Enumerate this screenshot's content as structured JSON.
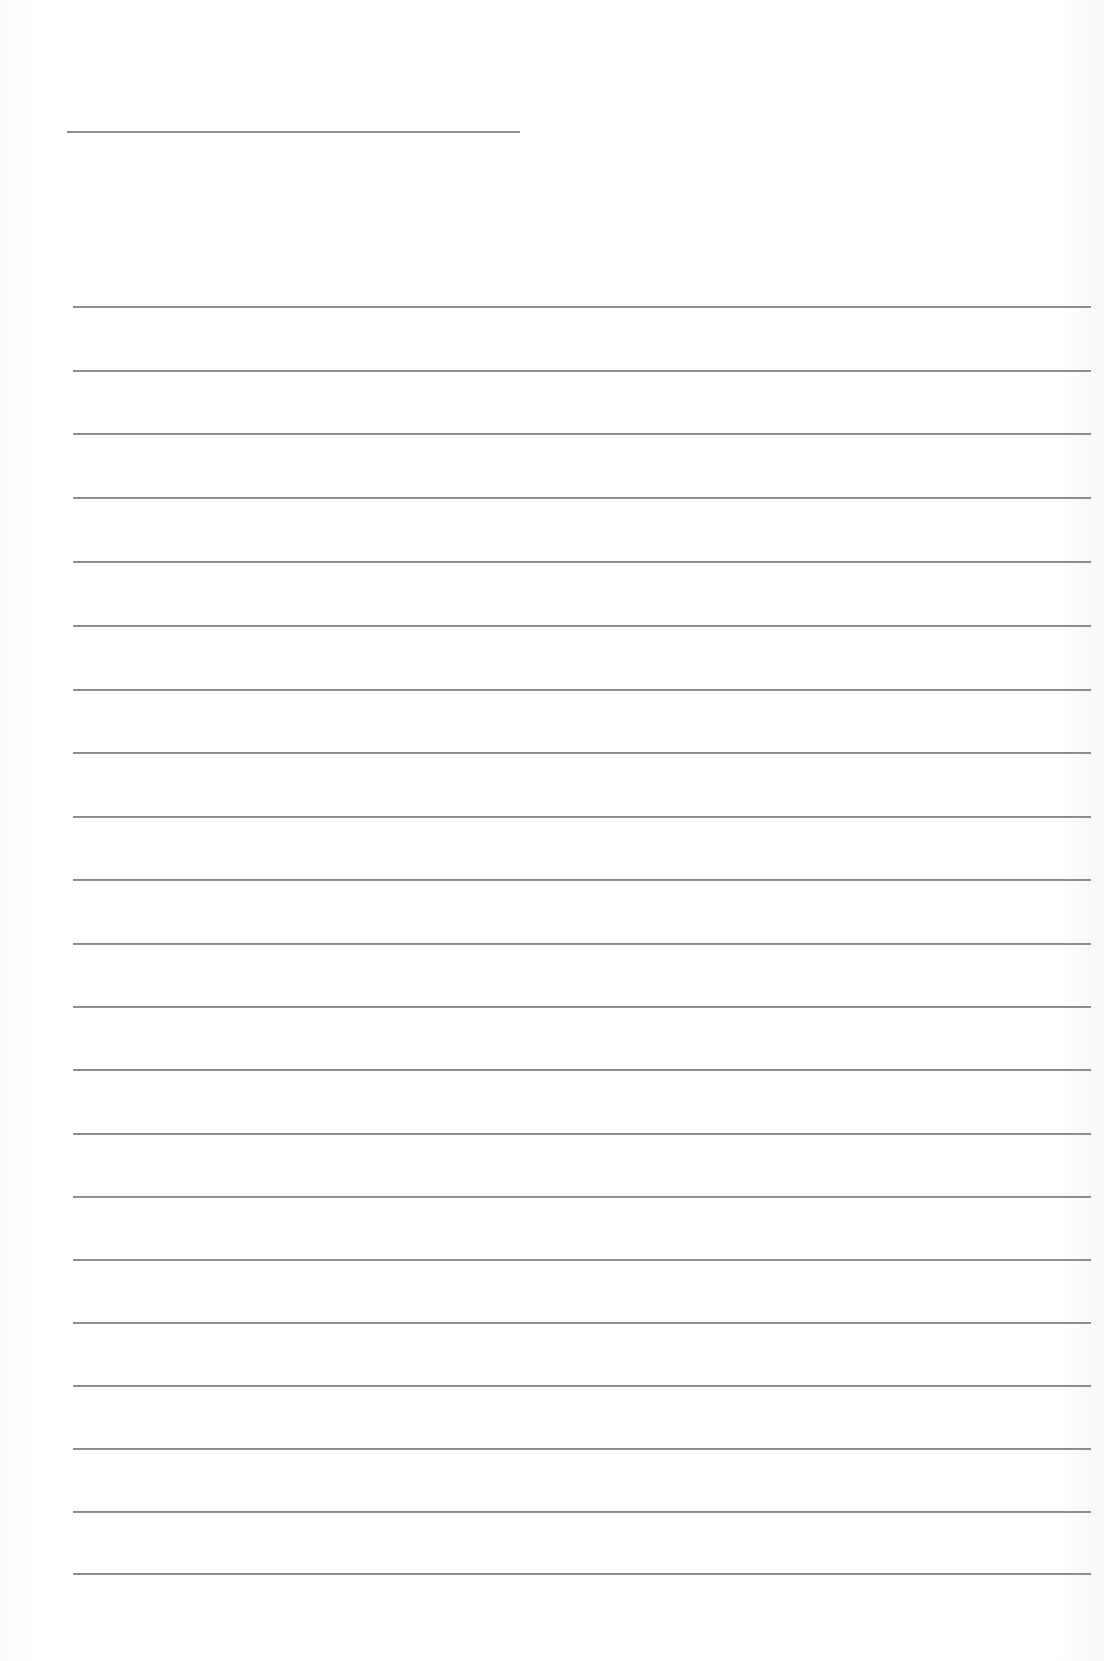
{
  "page": {
    "type": "lined-paper",
    "background_color": "#ffffff",
    "line_color": "#8a8a8a",
    "title_line": {
      "x_start": 67,
      "x_end": 520,
      "y": 131,
      "text": ""
    },
    "ruled_lines": {
      "x_start": 73,
      "x_end": 1091,
      "count": 21,
      "y_positions": [
        306,
        370,
        433,
        497,
        561,
        625,
        689,
        752,
        816,
        879,
        943,
        1006,
        1069,
        1133,
        1196,
        1259,
        1322,
        1385,
        1448,
        1511,
        1573
      ],
      "texts": [
        "",
        "",
        "",
        "",
        "",
        "",
        "",
        "",
        "",
        "",
        "",
        "",
        "",
        "",
        "",
        "",
        "",
        "",
        "",
        "",
        ""
      ]
    }
  }
}
